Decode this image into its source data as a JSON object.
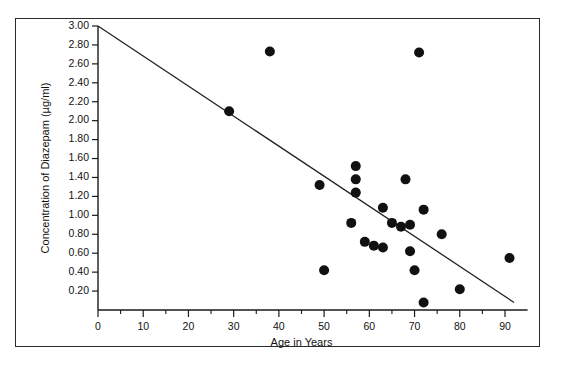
{
  "chart_data": {
    "type": "scatter",
    "title": "",
    "xlabel": "Age in Years",
    "ylabel": "Concentration of Diazepam (µg/ml)",
    "xlim": [
      0,
      95
    ],
    "ylim": [
      0,
      3.0
    ],
    "grid": false,
    "legend": false,
    "x_ticks": [
      0,
      10,
      20,
      30,
      40,
      50,
      60,
      70,
      80,
      90
    ],
    "x_tick_labels": [
      "0",
      "10",
      "20",
      "30",
      "40",
      "50",
      "60",
      "70",
      "80",
      "90"
    ],
    "x_minor_ticks": [
      5,
      15,
      25,
      35,
      45,
      55,
      65,
      75,
      85
    ],
    "y_ticks": [
      0.2,
      0.4,
      0.6,
      0.8,
      1.0,
      1.2,
      1.4,
      1.6,
      1.8,
      2.0,
      2.2,
      2.4,
      2.6,
      2.8,
      3.0
    ],
    "y_tick_labels": [
      "0.20",
      "0.40",
      "0.60",
      "0.80",
      "1.00",
      "1.20",
      "1.40",
      "1.60",
      "1.80",
      "2.00",
      "2.20",
      "2.40",
      "2.60",
      "2.80",
      "3.00"
    ],
    "marker": "filled-circle",
    "marker_color": "#111111",
    "marker_size": 10,
    "points": [
      {
        "x": 29,
        "y": 2.1
      },
      {
        "x": 38,
        "y": 2.73
      },
      {
        "x": 71,
        "y": 2.72
      },
      {
        "x": 49,
        "y": 1.32
      },
      {
        "x": 57,
        "y": 1.52
      },
      {
        "x": 57,
        "y": 1.38
      },
      {
        "x": 57,
        "y": 1.24
      },
      {
        "x": 56,
        "y": 0.92
      },
      {
        "x": 59,
        "y": 0.72
      },
      {
        "x": 61,
        "y": 0.68
      },
      {
        "x": 63,
        "y": 1.08
      },
      {
        "x": 63,
        "y": 0.66
      },
      {
        "x": 65,
        "y": 0.92
      },
      {
        "x": 67,
        "y": 0.88
      },
      {
        "x": 68,
        "y": 1.38
      },
      {
        "x": 69,
        "y": 0.9
      },
      {
        "x": 69,
        "y": 0.62
      },
      {
        "x": 70,
        "y": 0.42
      },
      {
        "x": 72,
        "y": 1.06
      },
      {
        "x": 72,
        "y": 0.08
      },
      {
        "x": 76,
        "y": 0.8
      },
      {
        "x": 50,
        "y": 0.42
      },
      {
        "x": 80,
        "y": 0.22
      },
      {
        "x": 91,
        "y": 0.55
      }
    ],
    "trendline": {
      "name": "regression-line",
      "x_start": 0,
      "y_start": 3.0,
      "x_end": 92,
      "y_end": 0.08,
      "color": "#222222"
    },
    "axis_color": "#1a1a1a",
    "frame_color": "#2b2b2b",
    "background": "#ffffff"
  }
}
